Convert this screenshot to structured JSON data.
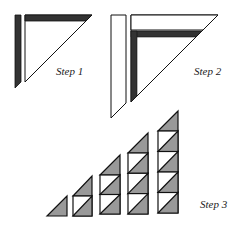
{
  "colors": {
    "stroke": "#111111",
    "dark_bar": "#333333",
    "gray_fill": "#999999",
    "white_fill": "#ffffff"
  },
  "steps": [
    {
      "label": "Step 1",
      "description": "Dark strip sewn to triangle top; second dark strip beside left edge"
    },
    {
      "label": "Step 2",
      "description": "White strip sewn to top; second white strip beside left edge"
    },
    {
      "label": "Step 3",
      "description": "Rows of half-square triangle units: 1, 2, 3, 4, 5 units tall"
    }
  ],
  "step3_columns": [
    {
      "units": 1
    },
    {
      "units": 2
    },
    {
      "units": 3
    },
    {
      "units": 4
    },
    {
      "units": 5
    }
  ]
}
